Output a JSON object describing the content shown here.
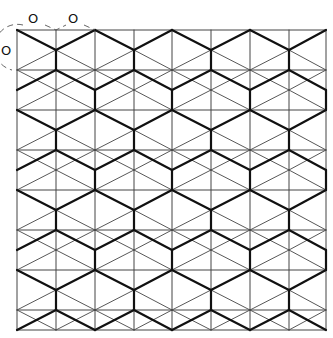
{
  "diagram": {
    "title": "",
    "colors": {
      "background": "#ffffff",
      "thin_line": "#444444",
      "thick_line": "#111111",
      "arc": "#555555"
    },
    "grid": {
      "columns_x": [
        17,
        56,
        95,
        134,
        172,
        211,
        250,
        289,
        326
      ],
      "rows_y": [
        30,
        70,
        110,
        150,
        190,
        230,
        270,
        310
      ],
      "bottom_y": 330,
      "half_row": 20
    },
    "labels": [
      {
        "text": "O",
        "x": 28,
        "y": 12
      },
      {
        "text": "O",
        "x": 68,
        "y": 12
      },
      {
        "text": "O",
        "x": 1,
        "y": 44
      }
    ]
  }
}
